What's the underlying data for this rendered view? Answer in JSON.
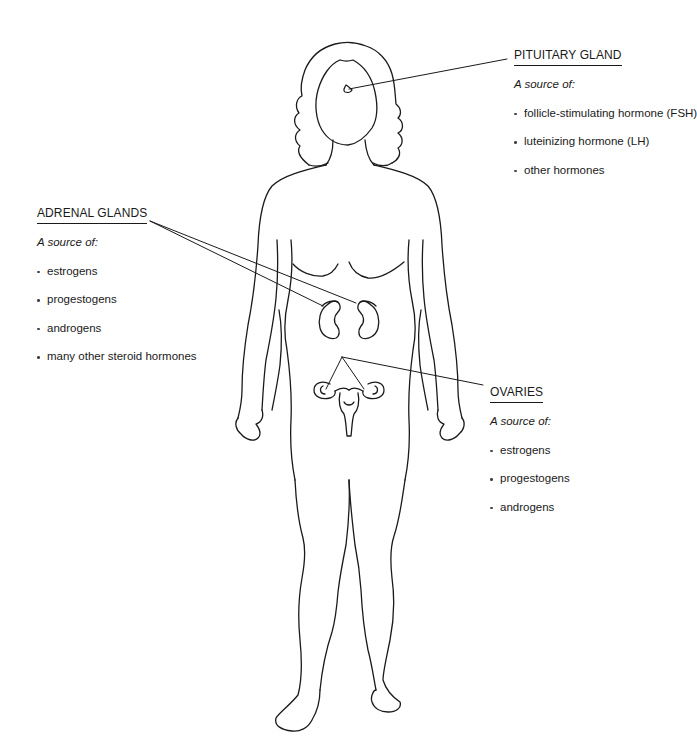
{
  "diagram": {
    "type": "anatomical-illustration",
    "line_color": "#1a1a1a",
    "background": "#ffffff"
  },
  "labels": {
    "pituitary": {
      "heading": "PITUITARY GLAND",
      "subtitle": "A source of:",
      "items": [
        "follicle-stimulating hormone (FSH)",
        "luteinizing hormone (LH)",
        "other hormones"
      ]
    },
    "adrenal": {
      "heading": "ADRENAL GLANDS",
      "subtitle": "A source of:",
      "items": [
        "estrogens",
        "progestogens",
        "androgens",
        "many other steroid hormones"
      ]
    },
    "ovaries": {
      "heading": "OVARIES",
      "subtitle": "A source of:",
      "items": [
        "estrogens",
        "progestogens",
        "androgens"
      ]
    }
  }
}
